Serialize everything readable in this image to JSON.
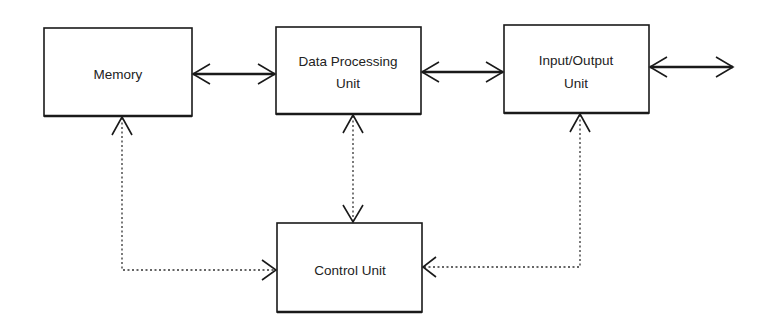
{
  "diagram": {
    "title": "",
    "blocks": {
      "memory": {
        "lines": [
          "Memory"
        ]
      },
      "data_processing_unit": {
        "lines": [
          "Data Processing",
          "Unit"
        ]
      },
      "io_unit": {
        "lines": [
          "Input/Output",
          "Unit"
        ]
      },
      "control_unit": {
        "lines": [
          "Control Unit"
        ]
      }
    },
    "connections": [
      {
        "from": "memory",
        "to": "data_processing_unit",
        "style": "solid",
        "direction": "bidirectional"
      },
      {
        "from": "data_processing_unit",
        "to": "io_unit",
        "style": "solid",
        "direction": "bidirectional"
      },
      {
        "from": "io_unit",
        "to": "external",
        "style": "solid",
        "direction": "bidirectional"
      },
      {
        "from": "control_unit",
        "to": "memory",
        "style": "dotted",
        "direction": "bidirectional"
      },
      {
        "from": "control_unit",
        "to": "data_processing_unit",
        "style": "dotted",
        "direction": "bidirectional"
      },
      {
        "from": "control_unit",
        "to": "io_unit",
        "style": "dotted",
        "direction": "bidirectional"
      }
    ]
  }
}
